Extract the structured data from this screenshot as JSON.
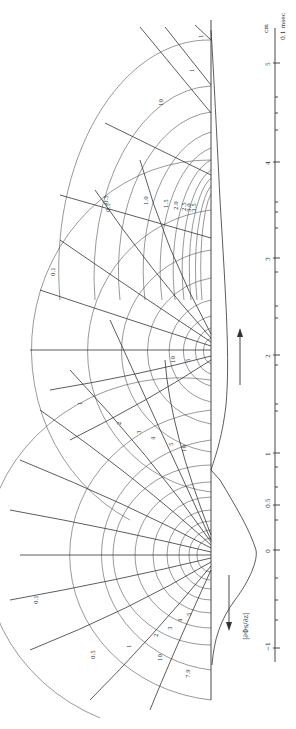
{
  "figure": {
    "orientation": "rotated-90-ccw",
    "boundary_x": 211,
    "boundary_top": 20,
    "boundary_bottom": 700,
    "ink_color": "#333333",
    "background": "#ffffff"
  },
  "scale": {
    "x": 275,
    "top": 28,
    "bottom": 660,
    "unit_label": "cm",
    "secondary_label": "0.1 msec",
    "ticks": [
      {
        "label": "5",
        "y": 63,
        "major": true
      },
      {
        "y": 97
      },
      {
        "y": 113
      },
      {
        "y": 130
      },
      {
        "label": "4",
        "y": 162,
        "major": true
      },
      {
        "y": 202
      },
      {
        "y": 212
      },
      {
        "y": 228
      },
      {
        "label": "3",
        "y": 258,
        "major": true
      },
      {
        "y": 272
      },
      {
        "y": 306
      },
      {
        "y": 318
      },
      {
        "label": "2",
        "y": 355,
        "major": true
      },
      {
        "y": 365
      },
      {
        "y": 404
      },
      {
        "y": 411
      },
      {
        "label": "1",
        "y": 453,
        "major": true
      },
      {
        "y": 467
      },
      {
        "y": 487
      },
      {
        "label": "0.5",
        "y": 505,
        "major": true
      },
      {
        "y": 520
      },
      {
        "label": "0",
        "y": 550,
        "major": true
      },
      {
        "y": 578
      },
      {
        "y": 600
      },
      {
        "y": 620
      },
      {
        "label": "−1",
        "y": 648,
        "major": true
      }
    ]
  },
  "profile_label": "|∂Φs/∂z|",
  "direction_arrows": [
    {
      "x": 240,
      "y1": 330,
      "y2": 385,
      "dir": "up"
    },
    {
      "x": 233,
      "y1": 630,
      "y2": 575,
      "dir": "down"
    }
  ],
  "current_source": {
    "y": 555
  },
  "current_sink": {
    "y": 350
  },
  "equipotential_labels": {
    "upper_sink": [
      "0.5",
      "1.0",
      "1.5",
      "2.0",
      "2.5",
      "3.0",
      "3.5"
    ],
    "upper_sink_far": [
      "10",
      "1",
      "1"
    ],
    "middle": [
      "0.1",
      "1",
      "2",
      "3",
      "4",
      "5",
      "10",
      "10",
      "5"
    ],
    "lower_source": [
      "0.1",
      "0.5",
      "1",
      "2",
      "3",
      "4",
      "5",
      "10",
      "7.9"
    ]
  },
  "labels": [
    {
      "text": "1",
      "x": 203,
      "y": 38,
      "rot": -90
    },
    {
      "text": "1",
      "x": 194,
      "y": 72,
      "rot": -90
    },
    {
      "text": "10",
      "x": 163,
      "y": 106,
      "rot": -90
    },
    {
      "text": "0.5",
      "x": 108,
      "y": 204,
      "rot": -90
    },
    {
      "text": "1.0",
      "x": 148,
      "y": 205,
      "rot": -90
    },
    {
      "text": "1.5",
      "x": 168,
      "y": 208,
      "rot": -90
    },
    {
      "text": "2.0",
      "x": 178,
      "y": 210,
      "rot": -90
    },
    {
      "text": "2.5",
      "x": 186,
      "y": 211,
      "rot": -90
    },
    {
      "text": "3.0",
      "x": 191,
      "y": 212,
      "rot": -90
    },
    {
      "text": "3.5",
      "x": 196,
      "y": 212,
      "rot": -90
    },
    {
      "text": "0.5",
      "x": 110,
      "y": 212,
      "rot": -90
    },
    {
      "text": "0.1",
      "x": 55,
      "y": 276,
      "rot": -90
    },
    {
      "text": "10",
      "x": 175,
      "y": 363,
      "rot": -90
    },
    {
      "text": "5",
      "x": 190,
      "y": 362,
      "rot": -90
    },
    {
      "text": "1",
      "x": 82,
      "y": 405,
      "rot": -90
    },
    {
      "text": "2",
      "x": 121,
      "y": 425,
      "rot": -90
    },
    {
      "text": "3",
      "x": 141,
      "y": 434,
      "rot": -90
    },
    {
      "text": "4",
      "x": 155,
      "y": 440,
      "rot": -90
    },
    {
      "text": "5",
      "x": 173,
      "y": 446,
      "rot": -90
    },
    {
      "text": "10",
      "x": 186,
      "y": 452,
      "rot": -90
    },
    {
      "text": "0.1",
      "x": 38,
      "y": 604,
      "rot": -90
    },
    {
      "text": "0.5",
      "x": 95,
      "y": 659,
      "rot": -90
    },
    {
      "text": "1",
      "x": 131,
      "y": 648,
      "rot": -90
    },
    {
      "text": "2",
      "x": 158,
      "y": 637,
      "rot": -90
    },
    {
      "text": "3",
      "x": 172,
      "y": 630,
      "rot": -90
    },
    {
      "text": "4",
      "x": 182,
      "y": 622,
      "rot": -90
    },
    {
      "text": "5",
      "x": 191,
      "y": 616,
      "rot": -90
    },
    {
      "text": "10",
      "x": 162,
      "y": 661,
      "rot": -90
    },
    {
      "text": "7.9",
      "x": 190,
      "y": 678,
      "rot": -90
    }
  ]
}
